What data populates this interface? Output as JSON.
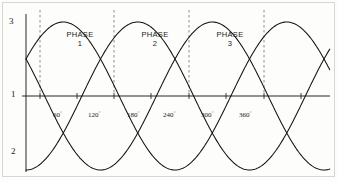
{
  "figure": {
    "background_color": "#fdfdfb",
    "frame_color": "#d8d6d0",
    "curve_color": "#111111",
    "axis_color": "#111111",
    "dash_color": "#777777"
  },
  "chart_data": {
    "type": "line",
    "title": "",
    "xlabel": "",
    "ylabel": "",
    "xlim": [
      0,
      480
    ],
    "ylim": [
      -1.15,
      1.15
    ],
    "grid": false,
    "legend_position": "inline-annotation",
    "axis_tick_labels": [
      "3",
      "1",
      "2"
    ],
    "y_axis_ticks": [
      {
        "label": "3",
        "value": 1.0,
        "px_y": 22
      },
      {
        "label": "1",
        "value": 0.0,
        "px_y": 96
      },
      {
        "label": "2",
        "value": -1.0,
        "px_y": 153
      }
    ],
    "x_tick_labels": [
      "60",
      "120",
      "180",
      "240",
      "300",
      "360"
    ],
    "x_tick_degrees": [
      60,
      120,
      180,
      240,
      300,
      360
    ],
    "degree_symbol": "°",
    "dashed_verticals_deg": [
      60,
      180,
      300,
      420
    ],
    "annotations": [
      {
        "text_line1": "PHASE",
        "text_line2": "1",
        "at_deg": 120
      },
      {
        "text_line1": "PHASE",
        "text_line2": "2",
        "at_deg": 240
      },
      {
        "text_line1": "PHASE",
        "text_line2": "3",
        "at_deg": 360
      }
    ],
    "series": [
      {
        "name": "Phase 1",
        "phase_deg": 0,
        "amplitude": 1.0,
        "period_deg": 360
      },
      {
        "name": "Phase 2",
        "phase_deg": 120,
        "amplitude": 1.0,
        "period_deg": 360
      },
      {
        "name": "Phase 3",
        "phase_deg": 240,
        "amplitude": 1.0,
        "period_deg": 360
      }
    ]
  },
  "labels": {
    "y_top": "3",
    "y_mid": "1",
    "y_bottom": "2",
    "deg_60": "60",
    "deg_120": "120",
    "deg_180": "180",
    "deg_240": "240",
    "deg_300": "300",
    "deg_360": "360",
    "degree_sign": "°",
    "phase_word": "PHASE",
    "phase_1": "1",
    "phase_2": "2",
    "phase_3": "3"
  }
}
